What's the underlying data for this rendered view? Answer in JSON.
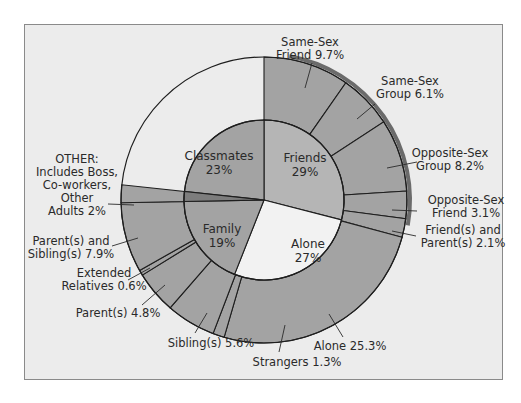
{
  "chart_data": {
    "type": "pie",
    "subtype": "nested-donut",
    "title": "",
    "inner_ring": {
      "categories": [
        "Friends",
        "Alone",
        "Family",
        "Classmates"
      ],
      "values": [
        29,
        27,
        19,
        23
      ],
      "labels": [
        {
          "name": "Friends",
          "value": "29%"
        },
        {
          "name": "Alone",
          "value": "27%"
        },
        {
          "name": "Family",
          "value": "19%"
        },
        {
          "name": "Classmates",
          "value": "23%"
        }
      ]
    },
    "outer_ring": {
      "categories": [
        "Same-Sex Friend",
        "Same-Sex Group",
        "Opposite-Sex Group",
        "Opposite-Sex Friend",
        "Friend(s) and Parent(s)",
        "Alone",
        "Strangers",
        "Sibling(s)",
        "Parent(s)",
        "Extended Relatives",
        "Parent(s) and Sibling(s)",
        "OTHER: Includes Boss, Co-workers, Other Adults"
      ],
      "values": [
        9.7,
        6.1,
        8.2,
        3.1,
        2.1,
        25.3,
        1.3,
        5.6,
        4.8,
        0.6,
        7.9,
        2
      ]
    },
    "annotations": {
      "ssf": [
        "Same-Sex",
        "Friend 9.7%"
      ],
      "ssg": [
        "Same-Sex",
        "Group 6.1%"
      ],
      "osg": [
        "Opposite-Sex",
        "Group 8.2%"
      ],
      "osf": [
        "Opposite-Sex",
        "Friend 3.1%"
      ],
      "fp": [
        "Friend(s) and",
        "Parent(s) 2.1%"
      ],
      "alone": [
        "Alone 25.3%"
      ],
      "strangers": [
        "Strangers 1.3%"
      ],
      "siblings": [
        "Sibling(s) 5.6%"
      ],
      "parents": [
        "Parent(s) 4.8%"
      ],
      "extended": [
        "Extended",
        "Relatives 0.6%"
      ],
      "ps": [
        "Parent(s) and",
        "Sibling(s) 7.9%"
      ],
      "other": [
        "OTHER:",
        "Includes Boss,",
        "Co-workers,",
        "Other",
        "Adults 2%"
      ]
    },
    "colors": {
      "background": "#ececec",
      "segment": "#a3a3a3",
      "friends_inner": "#b5b5b5",
      "alone_inner": "#f2f2f2",
      "other": "#7d7d7d",
      "rim": "#6b6b6b",
      "line": "#1e1e1e"
    },
    "legend": "none"
  }
}
